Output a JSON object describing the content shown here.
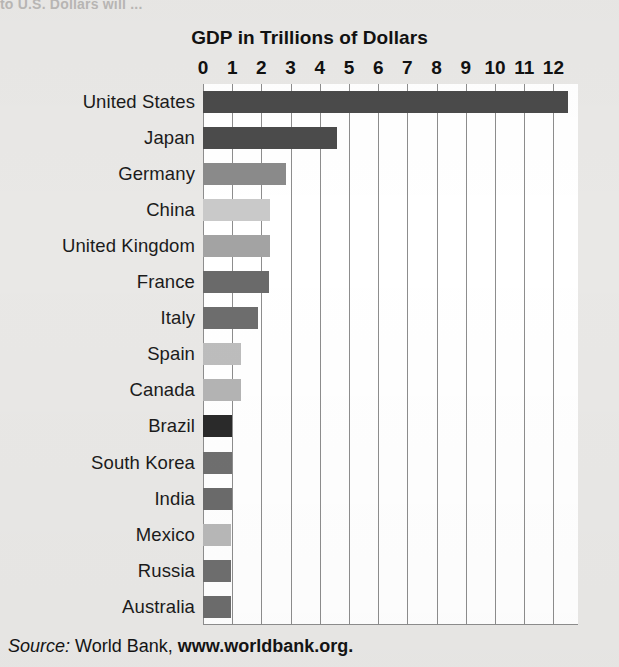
{
  "page": {
    "cut_off_header": "to U.S. Dollars will ...",
    "background_color": "#e9e8e6",
    "plot_background_color": "#ffffff",
    "gridline_color": "#8d8d8d"
  },
  "source": {
    "prefix": "Source:",
    "publisher": "World Bank,",
    "url": "www.worldbank.org."
  },
  "chart_data": {
    "type": "bar",
    "orientation": "horizontal",
    "title": "GDP in Trillions of Dollars",
    "xlabel": "",
    "ylabel": "",
    "xlim": [
      0,
      12.8
    ],
    "grid": true,
    "legend": "none",
    "tick_labels": [
      "0",
      "1",
      "2",
      "3",
      "4",
      "5",
      "6",
      "7",
      "8",
      "9",
      "10",
      "11",
      "12"
    ],
    "tick_values": [
      0,
      1,
      2,
      3,
      4,
      5,
      6,
      7,
      8,
      9,
      10,
      11,
      12
    ],
    "categories": [
      "United States",
      "Japan",
      "Germany",
      "China",
      "United Kingdom",
      "France",
      "Italy",
      "Spain",
      "Canada",
      "Brazil",
      "South Korea",
      "India",
      "Mexico",
      "Russia",
      "Australia"
    ],
    "values": [
      12.5,
      4.6,
      2.85,
      2.3,
      2.3,
      2.25,
      1.9,
      1.3,
      1.3,
      1.0,
      1.0,
      1.0,
      0.95,
      0.95,
      0.95
    ],
    "bar_colors": [
      "#4a4a4a",
      "#4b4b4b",
      "#8a8a8a",
      "#c9c9c9",
      "#a3a3a3",
      "#6a6a6a",
      "#6d6d6d",
      "#bdbdbd",
      "#b4b4b4",
      "#2a2a2a",
      "#6f6f6f",
      "#6b6b6b",
      "#b8b8b8",
      "#6e6e6e",
      "#6c6c6c"
    ]
  }
}
